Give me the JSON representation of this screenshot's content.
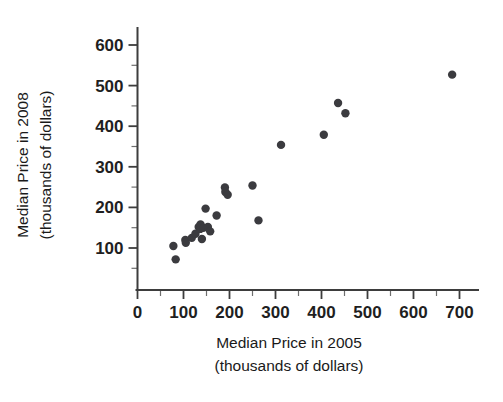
{
  "chart_data": {
    "type": "scatter",
    "title": "",
    "xlabel": "Median Price in 2005 (thousands of dollars)",
    "xlabel_line1": "Median Price in 2005",
    "xlabel_line2": "(thousands of dollars)",
    "ylabel": "Median Price in 2008 (thousands of dollars)",
    "ylabel_line1": "Median Price in 2008",
    "ylabel_line2": "(thousands of dollars)",
    "xlim": [
      0,
      730
    ],
    "ylim": [
      0,
      640
    ],
    "xticks": [
      0,
      100,
      200,
      300,
      400,
      500,
      600,
      700
    ],
    "yticks": [
      100,
      200,
      300,
      400,
      500,
      600
    ],
    "xtick_labels": [
      "0",
      "100",
      "200",
      "300",
      "400",
      "500",
      "600",
      "700"
    ],
    "ytick_labels": [
      "100",
      "200",
      "300",
      "400",
      "500",
      "600"
    ],
    "x_minor_tick_interval": 50,
    "y_minor_tick_interval": 50,
    "grid": false,
    "legend": null,
    "marker_color": "#3b3b3f",
    "marker_size": 4.2,
    "points": [
      {
        "x": 78,
        "y": 105
      },
      {
        "x": 83,
        "y": 72
      },
      {
        "x": 104,
        "y": 120
      },
      {
        "x": 105,
        "y": 113
      },
      {
        "x": 118,
        "y": 125
      },
      {
        "x": 126,
        "y": 135
      },
      {
        "x": 133,
        "y": 152
      },
      {
        "x": 136,
        "y": 147
      },
      {
        "x": 137,
        "y": 158
      },
      {
        "x": 140,
        "y": 122
      },
      {
        "x": 143,
        "y": 150
      },
      {
        "x": 148,
        "y": 197
      },
      {
        "x": 153,
        "y": 152
      },
      {
        "x": 158,
        "y": 141
      },
      {
        "x": 172,
        "y": 180
      },
      {
        "x": 190,
        "y": 249
      },
      {
        "x": 191,
        "y": 238
      },
      {
        "x": 196,
        "y": 231
      },
      {
        "x": 250,
        "y": 254
      },
      {
        "x": 263,
        "y": 168
      },
      {
        "x": 312,
        "y": 354
      },
      {
        "x": 405,
        "y": 379
      },
      {
        "x": 436,
        "y": 457
      },
      {
        "x": 452,
        "y": 432
      },
      {
        "x": 684,
        "y": 527
      }
    ]
  },
  "axes": {
    "x_axis_name": "x-axis",
    "y_axis_name": "y-axis"
  }
}
